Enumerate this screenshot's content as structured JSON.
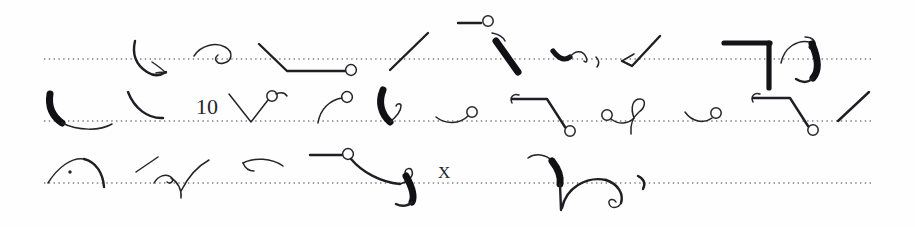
{
  "document": {
    "title": "Handwritten shorthand manuscript",
    "medium": "scanned ink on dotted ruled paper",
    "script_system": "Gregg-style shorthand outlines",
    "page_width": 915,
    "page_height": 227,
    "background_color": "#fefefe",
    "ink_color": "#24242a",
    "rule_color": "#5a5a5a"
  },
  "ruled_lines": [
    {
      "id": "rule-1",
      "y": 59,
      "x_start": 44,
      "x_end": 872
    },
    {
      "id": "rule-2",
      "y": 121,
      "x_start": 44,
      "x_end": 872
    },
    {
      "id": "rule-3",
      "y": 183,
      "x_start": 44,
      "x_end": 872
    }
  ],
  "legible_characters": [
    {
      "id": "numeral-10",
      "text": "10",
      "line": 2,
      "x": 196,
      "y": 114
    },
    {
      "id": "letter-x",
      "text": "X",
      "line": 3,
      "x": 438,
      "y": 178
    }
  ],
  "lines": [
    {
      "id": "line-1",
      "index": 1,
      "baseline_y": 59,
      "outline_count": 9,
      "description": "Nine shorthand outlines written across the first dotted rule, including a heavy downstroke group and a right-angle bracket form."
    },
    {
      "id": "line-2",
      "index": 2,
      "baseline_y": 121,
      "outline_count": 11,
      "description": "Eleven shorthand outlines on the second rule, with the arabic numeral 10 inserted mid-line."
    },
    {
      "id": "line-3",
      "index": 3,
      "baseline_y": 183,
      "outline_count": 8,
      "description": "Eight shorthand outlines on the third rule, terminating early with the letter X and a final looped form; the rule continues blank to the right margin."
    }
  ]
}
